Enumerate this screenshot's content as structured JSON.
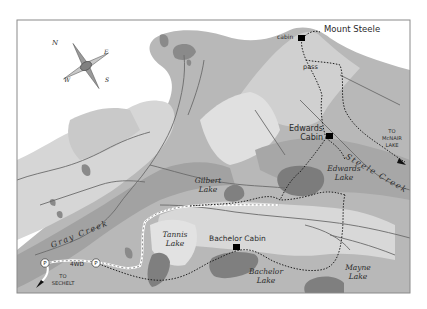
{
  "map": {
    "colors": {
      "background": "#ffffff",
      "frame": "#8a8a8a",
      "terrain_dark": "#9c9c9c",
      "terrain_mid": "#b3b3b3",
      "terrain_light": "#c8c8c8",
      "terrain_pale": "#dcdcdc",
      "lake": "#7f7f7f",
      "river": "#6e6e6e",
      "trail": "#1e1e1e",
      "road": "#ffffff",
      "cabin": "#000000"
    },
    "compass": {
      "labels": {
        "n": "N",
        "e": "E",
        "s": "S",
        "w": "W"
      }
    },
    "peaks": [
      {
        "name": "Mount Steele"
      }
    ],
    "features": {
      "cabin_top": "cabin",
      "pass": "pass",
      "edwards_cabin_line1": "Edwards",
      "edwards_cabin_line2": "Cabin",
      "bachelor_cabin": "Bachelor Cabin"
    },
    "lakes": {
      "gilbert_1": "Gilbert",
      "gilbert_2": "Lake",
      "edwards_1": "Edwards",
      "edwards_2": "Lake",
      "tannis_1": "Tannis",
      "tannis_2": "Lake",
      "bachelor_1": "Bachelor",
      "bachelor_2": "Lake",
      "mayne_1": "Mayne",
      "mayne_2": "Lake"
    },
    "creeks": {
      "gray": "Gray Creek",
      "steele": "Steele Creek"
    },
    "directions": {
      "mcnair_1": "TO",
      "mcnair_2": "McNAIR",
      "mcnair_3": "LAKE",
      "sechelt_1": "TO",
      "sechelt_2": "SECHELT"
    },
    "road": {
      "label": "4WD",
      "parking_symbol": "P"
    }
  }
}
